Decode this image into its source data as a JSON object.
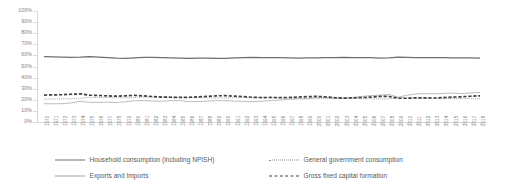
{
  "chart_data": {
    "type": "line",
    "title": "",
    "xlabel": "",
    "ylabel": "",
    "ylim": [
      0,
      100
    ],
    "ytick_labels": [
      "100%",
      "90%",
      "80%",
      "70%",
      "60%",
      "50%",
      "40%",
      "30%",
      "20%",
      "10%",
      "0%"
    ],
    "ytick_values": [
      100,
      90,
      80,
      70,
      60,
      50,
      40,
      30,
      20,
      10,
      0
    ],
    "grid": false,
    "legend_position": "bottom",
    "x": [
      1970,
      1971,
      1972,
      1973,
      1974,
      1975,
      1976,
      1977,
      1978,
      1979,
      1980,
      1981,
      1982,
      1983,
      1984,
      1985,
      1986,
      1987,
      1988,
      1989,
      1990,
      1991,
      1992,
      1993,
      1994,
      1995,
      1996,
      1997,
      1998,
      1999,
      2000,
      2001,
      2002,
      2003,
      2004,
      2005,
      2006,
      2007,
      2008,
      2009,
      2010,
      2011,
      2012,
      2013,
      2014,
      2015,
      2016,
      2017,
      2018
    ],
    "categories": [
      "1970",
      "1971",
      "1972",
      "1973",
      "1974",
      "1975",
      "1976",
      "1977",
      "1978",
      "1979",
      "1980",
      "1981",
      "1982",
      "1983",
      "1984",
      "1985",
      "1986",
      "1987",
      "1988",
      "1989",
      "1990",
      "1991",
      "1992",
      "1993",
      "1994",
      "1995",
      "1996",
      "1997",
      "1998",
      "1999",
      "2000",
      "2001",
      "2002",
      "2003",
      "2004",
      "2005",
      "2006",
      "2007",
      "2008",
      "2009",
      "2010",
      "2011",
      "2012",
      "2013",
      "2014",
      "2015",
      "2016",
      "2017",
      "2018"
    ],
    "series": [
      {
        "name": "Household consumption (including NPISH)",
        "style": "solid-thick",
        "color": "#6e6e6e",
        "values": [
          58.8,
          58.6,
          58.4,
          58.2,
          58.4,
          58.9,
          58.4,
          57.9,
          57.5,
          57.4,
          57.8,
          58.2,
          58.3,
          58.1,
          57.8,
          57.6,
          57.4,
          57.6,
          57.5,
          57.3,
          57.4,
          57.8,
          58.0,
          58.3,
          58.1,
          57.9,
          58.0,
          57.8,
          57.6,
          57.7,
          57.8,
          57.9,
          58.1,
          58.2,
          58.0,
          58.1,
          57.9,
          57.6,
          57.8,
          58.4,
          58.2,
          58.0,
          58.1,
          58.0,
          57.9,
          57.7,
          57.8,
          57.7,
          57.6
        ]
      },
      {
        "name": "General government consumption",
        "style": "dotted",
        "color": "#8c8c8c",
        "values": [
          20.6,
          20.8,
          20.9,
          21.0,
          21.4,
          22.2,
          22.1,
          22.0,
          22.0,
          21.9,
          22.1,
          22.4,
          22.5,
          22.4,
          22.2,
          22.1,
          22.0,
          22.1,
          21.9,
          21.6,
          21.6,
          21.9,
          22.1,
          22.2,
          22.0,
          21.8,
          21.7,
          21.4,
          21.2,
          21.1,
          21.0,
          21.1,
          21.3,
          21.4,
          21.2,
          21.1,
          20.9,
          20.7,
          20.9,
          21.8,
          21.7,
          21.4,
          21.4,
          21.3,
          21.2,
          21.1,
          21.1,
          21.0,
          21.0
        ]
      },
      {
        "name": "Exports and Imports",
        "style": "solid-thin",
        "color": "#a6a6a6",
        "values": [
          16.5,
          16.4,
          16.5,
          17.2,
          18.6,
          17.6,
          17.8,
          17.8,
          17.6,
          18.3,
          19.1,
          19.3,
          18.9,
          18.7,
          19.3,
          19.3,
          18.3,
          18.4,
          18.8,
          19.3,
          19.2,
          18.8,
          18.6,
          18.3,
          18.7,
          19.4,
          19.7,
          20.5,
          20.8,
          20.9,
          22.2,
          22.1,
          21.7,
          21.5,
          22.2,
          23.0,
          23.8,
          24.2,
          24.8,
          22.3,
          24.2,
          25.3,
          25.6,
          25.4,
          25.8,
          26.0,
          25.6,
          26.2,
          26.6
        ]
      },
      {
        "name": "Gross fixed capital formation",
        "style": "dashed-bold",
        "color": "#404040",
        "values": [
          24.3,
          24.4,
          24.6,
          25.0,
          25.3,
          24.2,
          23.9,
          23.5,
          23.3,
          23.6,
          24.0,
          23.5,
          22.9,
          22.4,
          22.3,
          22.2,
          22.3,
          22.6,
          23.1,
          23.6,
          23.7,
          23.3,
          22.9,
          22.2,
          22.0,
          22.1,
          22.0,
          22.1,
          22.4,
          22.8,
          23.1,
          22.6,
          21.9,
          21.5,
          21.7,
          22.0,
          22.5,
          23.0,
          23.0,
          21.4,
          21.4,
          21.8,
          21.7,
          21.6,
          22.0,
          22.4,
          22.7,
          23.2,
          23.6
        ]
      }
    ]
  },
  "legend": {
    "items": [
      {
        "label": "Household consumption (including NPISH)",
        "key": "solid-thick"
      },
      {
        "label": "General government consumption",
        "key": "dotted"
      },
      {
        "label": "Exports and Imports",
        "key": "solid-thin"
      },
      {
        "label": "Gross fixed capital formation",
        "key": "dashed-bold"
      }
    ]
  }
}
